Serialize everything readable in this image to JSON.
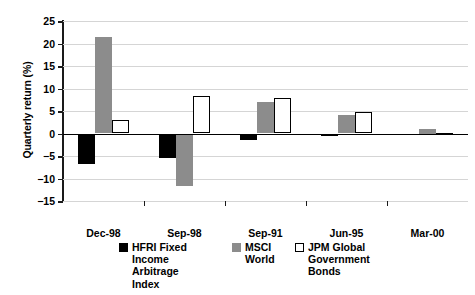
{
  "chart_data": {
    "type": "bar",
    "title": "",
    "xlabel": "",
    "ylabel": "Quarterly return (%)",
    "categories": [
      "Dec-98",
      "Sep-98",
      "Sep-91",
      "Jun-95",
      "Mar-00"
    ],
    "series": [
      {
        "name": "HFRI Fixed\nIncome Arbitrage\nIndex",
        "color": "#000000",
        "values": [
          -6.8,
          -5.5,
          -1.4,
          -0.6,
          -0.3
        ]
      },
      {
        "name": "MSCI\nWorld",
        "color": "#8c8c8c",
        "values": [
          21.4,
          -11.6,
          7.1,
          4.1,
          1.0
        ]
      },
      {
        "name": "JPM Global\nGovernment\nBonds",
        "color": "#ffffff",
        "values": [
          3.1,
          8.3,
          7.8,
          4.8,
          0.2
        ]
      }
    ],
    "ylim": [
      -15,
      25
    ],
    "yticks": [
      25,
      20,
      15,
      10,
      5,
      0,
      -5,
      -10,
      -15
    ],
    "ytick_labels": [
      "25",
      "20",
      "15",
      "10",
      "5",
      "0",
      "−5",
      "−10",
      "−15"
    ],
    "grid": true,
    "legend_position": "bottom"
  }
}
